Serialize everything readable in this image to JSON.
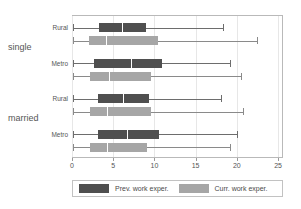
{
  "chart_data": {
    "type": "box",
    "title": "",
    "xlabel": "",
    "ylabel": "",
    "orientation": "horizontal",
    "xlim": [
      0,
      25.6
    ],
    "xticks": [
      0,
      5,
      10,
      15,
      20,
      25
    ],
    "xticklabels": [
      "0",
      "5",
      "10",
      "15",
      "20",
      "25"
    ],
    "grid": true,
    "grid_axis": "x",
    "group_labels": [
      "single",
      "married"
    ],
    "category_labels": [
      "Rural",
      "Metro",
      "Rural",
      "Metro"
    ],
    "legend": {
      "position": "bottom",
      "entries": [
        {
          "label": "Prev. work exper.",
          "color": "#4f4f4f",
          "key": "prev"
        },
        {
          "label": "Curr. work exper.",
          "color": "#a6a6a6",
          "key": "curr"
        }
      ]
    },
    "colors": {
      "prev": "#4f4f4f",
      "curr": "#a6a6a6",
      "median": "#ffffff",
      "whisker": "#8a8a8a",
      "frame": "#b9b9b9",
      "grid": "#e7e7e7",
      "text": "#555555"
    },
    "groups": [
      {
        "group": "single",
        "category": "Rural",
        "boxes": [
          {
            "series": "Prev. work exper.",
            "key": "prev",
            "whisker_low": 0.1,
            "q1": 3.3,
            "median": 6.1,
            "q3": 9.0,
            "whisker_high": 18.3
          },
          {
            "series": "Curr. work exper.",
            "key": "curr",
            "whisker_low": 0.1,
            "q1": 2.1,
            "median": 4.1,
            "q3": 10.4,
            "whisker_high": 22.5
          }
        ]
      },
      {
        "group": "single",
        "category": "Metro",
        "boxes": [
          {
            "series": "Prev. work exper.",
            "key": "prev",
            "whisker_low": 0.1,
            "q1": 2.7,
            "median": 7.1,
            "q3": 10.9,
            "whisker_high": 19.2
          },
          {
            "series": "Curr. work exper.",
            "key": "curr",
            "whisker_low": 0.1,
            "q1": 2.2,
            "median": 4.5,
            "q3": 9.6,
            "whisker_high": 20.5
          }
        ]
      },
      {
        "group": "married",
        "category": "Rural",
        "boxes": [
          {
            "series": "Prev. work exper.",
            "key": "prev",
            "whisker_low": 0.1,
            "q1": 3.2,
            "median": 6.2,
            "q3": 9.4,
            "whisker_high": 18.1
          },
          {
            "series": "Curr. work exper.",
            "key": "curr",
            "whisker_low": 0.1,
            "q1": 2.2,
            "median": 4.3,
            "q3": 9.6,
            "whisker_high": 20.8
          }
        ]
      },
      {
        "group": "married",
        "category": "Metro",
        "boxes": [
          {
            "series": "Prev. work exper.",
            "key": "prev",
            "whisker_low": 0.1,
            "q1": 3.2,
            "median": 6.7,
            "q3": 10.5,
            "whisker_high": 20.0
          },
          {
            "series": "Curr. work exper.",
            "key": "curr",
            "whisker_low": 0.1,
            "q1": 2.2,
            "median": 4.3,
            "q3": 9.1,
            "whisker_high": 19.2
          }
        ]
      }
    ]
  }
}
